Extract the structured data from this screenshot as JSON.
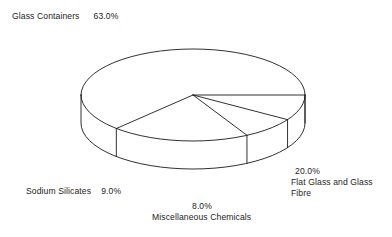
{
  "chart_data": {
    "type": "pie",
    "title": "",
    "subtitle": "",
    "xlabel": "",
    "ylabel": "",
    "legend_position": "none",
    "grid": false,
    "style": "3d-wireframe",
    "labels": [
      "Glass Containers",
      "Flat Glass and Glass Fibre",
      "Miscellaneous Chemicals",
      "Sodium Silicates"
    ],
    "values": [
      63.0,
      20.0,
      8.0,
      9.0
    ],
    "value_suffix": "%",
    "slices": [
      {
        "name": "Glass Containers",
        "value": 63.0,
        "percent_text": "63.0%",
        "label_position": "top-left"
      },
      {
        "name": "Flat Glass and Glass Fibre",
        "value": 20.0,
        "percent_text": "20.0%",
        "label_position": "bottom-right"
      },
      {
        "name": "Miscellaneous Chemicals",
        "value": 8.0,
        "percent_text": "8.0%",
        "label_position": "bottom-center"
      },
      {
        "name": "Sodium Silicates",
        "value": 9.0,
        "percent_text": "9.0%",
        "label_position": "bottom-left"
      }
    ],
    "colors": {
      "outline": "#1a1a1a",
      "fill": "#ffffff",
      "background": "#ffffff",
      "text": "#1e1e1e"
    },
    "geometry": {
      "center_x": 193,
      "center_y": 95,
      "radius_x": 112,
      "radius_y": 46,
      "depth": 28,
      "start_angle_deg": 0
    }
  },
  "labels": {
    "glass_containers": {
      "name": "Glass Containers",
      "percent": "63.0%"
    },
    "sodium_silicates": {
      "name": "Sodium Silicates",
      "percent": "9.0%"
    },
    "misc_chemicals": {
      "name": "Miscellaneous Chemicals",
      "percent": "8.0%"
    },
    "flat_glass": {
      "name_line_1": "Flat Glass and Glass",
      "name_line_2": "Fibre",
      "percent": "20.0%"
    }
  }
}
